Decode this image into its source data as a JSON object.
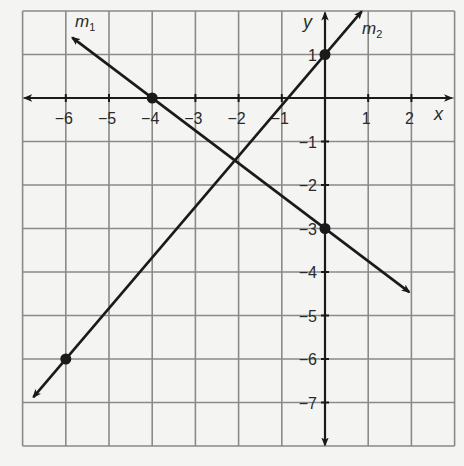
{
  "chart_data": {
    "type": "line",
    "title": "",
    "xlabel": "x",
    "ylabel": "y",
    "xlim": [
      -7,
      3
    ],
    "ylim": [
      -8,
      2
    ],
    "grid": true,
    "grid_step": 1,
    "x_ticks": [
      -6,
      -5,
      -4,
      -3,
      -2,
      -1,
      1,
      2
    ],
    "y_ticks": [
      1,
      -1,
      -2,
      -3,
      -4,
      -5,
      -6,
      -7
    ],
    "x_tick_labels": [
      "−6",
      "−5",
      "−4",
      "−3",
      "−2",
      "−1",
      "1",
      "2"
    ],
    "y_tick_labels": [
      "1",
      "−1",
      "−2",
      "−3",
      "−4",
      "−5",
      "−6",
      "−7"
    ],
    "series": [
      {
        "name": "m1",
        "label_main": "m",
        "label_sub": "1",
        "slope": -0.75,
        "y_intercept": -3,
        "marked_points": [
          [
            -4,
            0
          ],
          [
            0,
            -3
          ]
        ],
        "extent_x": [
          -5.85,
          1.95
        ],
        "arrows": "both"
      },
      {
        "name": "m2",
        "label_main": "m",
        "label_sub": "2",
        "slope": 1.1667,
        "y_intercept": 1,
        "marked_points": [
          [
            -6,
            -6
          ],
          [
            0,
            1
          ]
        ],
        "extent_x": [
          -6.75,
          0.85
        ],
        "arrows": "both"
      }
    ],
    "legend": "none (inline labels m1, m2 near arrow tips)"
  },
  "axes": {
    "x_label": "x",
    "y_label": "y"
  },
  "colors": {
    "background": "#f4f4f2",
    "grid": "#8a8a8a",
    "ink": "#1a1a1a"
  }
}
